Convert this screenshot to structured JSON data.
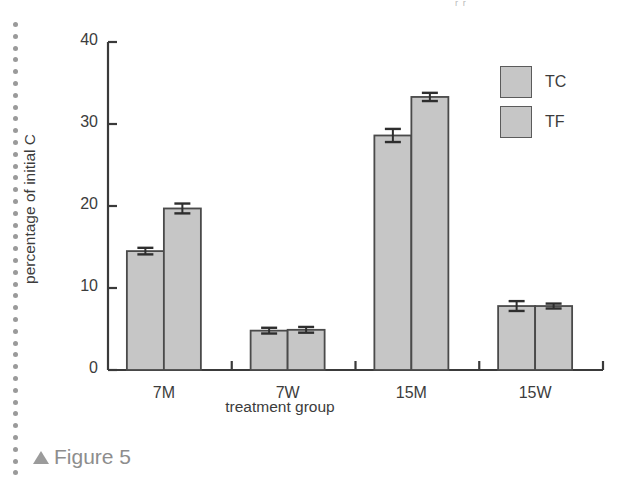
{
  "page": {
    "bleed_text_fragment": "ᵣ ᵣ",
    "caption": {
      "marker": "triangle-up",
      "text": "Figure 5"
    },
    "margin_dot_count": 39,
    "margin_dot_color": "#9a9a9a"
  },
  "legend": {
    "position": "top-right",
    "entries": [
      {
        "label": "TC",
        "swatch_color": "#c6c6c6",
        "edge_color": "#5b5b5b"
      },
      {
        "label": "TF",
        "swatch_color": "#c6c6c6",
        "edge_color": "#5b5b5b"
      }
    ]
  },
  "chart_data": {
    "type": "bar",
    "title": "",
    "subtitle": "",
    "xlabel": "treatment group",
    "ylabel": "percentage of initial C",
    "categories": [
      "7M",
      "7W",
      "15M",
      "15W"
    ],
    "series": [
      {
        "name": "TC",
        "values": [
          14.5,
          4.8,
          28.6,
          7.8
        ],
        "errors": [
          0.4,
          0.35,
          0.8,
          0.6
        ],
        "color": "#c6c6c6",
        "edge_color": "#4a4a4a"
      },
      {
        "name": "TF",
        "values": [
          19.7,
          4.9,
          33.3,
          7.8
        ],
        "errors": [
          0.6,
          0.35,
          0.5,
          0.3
        ],
        "color": "#c6c6c6",
        "edge_color": "#4a4a4a"
      }
    ],
    "yticks": [
      0,
      10,
      20,
      30,
      40
    ],
    "ytick_labels": [
      "0",
      "10",
      "20",
      "30",
      "40"
    ],
    "ylim": [
      0,
      40
    ],
    "xtick_labels": [
      "7M",
      "7W",
      "15M",
      "15W"
    ],
    "grid": false,
    "legend_labels": [
      "TC",
      "TF"
    ],
    "error_bar_style": "capped-symmetric",
    "axis_color": "#3a3a3a"
  }
}
